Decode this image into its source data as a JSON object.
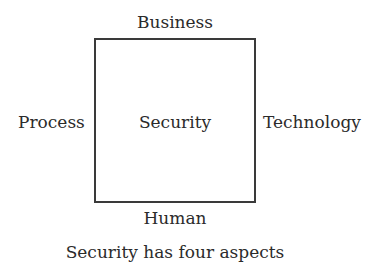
{
  "diagram": {
    "center": "Security",
    "top": "Business",
    "left": "Process",
    "right": "Technology",
    "bottom": "Human",
    "caption": "Security has four aspects"
  },
  "colors": {
    "line": "#3a3a3a",
    "text": "#2b2b2b",
    "background": "#ffffff"
  }
}
